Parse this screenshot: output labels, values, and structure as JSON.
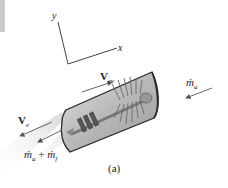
{
  "figure": {
    "caption": "(a)",
    "axes": {
      "y_label": "y",
      "x_label": "x"
    },
    "labels": {
      "v_cv": {
        "symbol": "V",
        "subscript": "cv"
      },
      "v_e": {
        "symbol": "V",
        "subscript": "e"
      },
      "m_a_in": {
        "symbol": "ṁ",
        "subscript": "a"
      },
      "m_out": {
        "text_a": "ṁ",
        "sub_a": "a",
        "plus": "+",
        "text_f": "ṁ",
        "sub_f": "f"
      }
    },
    "colors": {
      "engine_body": "#bdbdbd",
      "engine_outline": "#2a2a2a",
      "exhaust": "#e4e4e4",
      "arrow": "#555555",
      "axis": "#444444"
    }
  }
}
